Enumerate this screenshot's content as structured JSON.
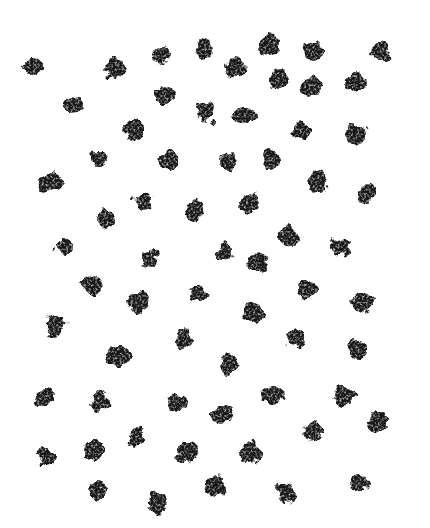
{
  "image": {
    "description": "Hand-drawn charcoal polka-dot pattern: irregular grainy dark-gray dots scattered in a loose diagonal grid on a white background",
    "background_color": "#ffffff",
    "dot_color": "#2f2f2f",
    "canvas": {
      "width": 430,
      "height": 528
    },
    "dot_count": 65,
    "dots": [
      {
        "x": 32,
        "y": 67,
        "rx": 11,
        "ry": 8,
        "rot": -10
      },
      {
        "x": 115,
        "y": 67,
        "rx": 10,
        "ry": 11,
        "rot": 0
      },
      {
        "x": 161,
        "y": 55,
        "rx": 9,
        "ry": 10,
        "rot": 0
      },
      {
        "x": 203,
        "y": 50,
        "rx": 10,
        "ry": 9,
        "rot": 0
      },
      {
        "x": 235,
        "y": 68,
        "rx": 10,
        "ry": 10,
        "rot": 0
      },
      {
        "x": 269,
        "y": 45,
        "rx": 11,
        "ry": 10,
        "rot": 0
      },
      {
        "x": 313,
        "y": 52,
        "rx": 11,
        "ry": 10,
        "rot": 0
      },
      {
        "x": 380,
        "y": 51,
        "rx": 10,
        "ry": 9,
        "rot": 15
      },
      {
        "x": 73,
        "y": 105,
        "rx": 9,
        "ry": 9,
        "rot": 0
      },
      {
        "x": 165,
        "y": 96,
        "rx": 9,
        "ry": 10,
        "rot": 0
      },
      {
        "x": 207,
        "y": 112,
        "rx": 9,
        "ry": 10,
        "rot": 0
      },
      {
        "x": 245,
        "y": 115,
        "rx": 10,
        "ry": 9,
        "rot": 0
      },
      {
        "x": 279,
        "y": 80,
        "rx": 9,
        "ry": 9,
        "rot": 0
      },
      {
        "x": 310,
        "y": 86,
        "rx": 10,
        "ry": 9,
        "rot": 0
      },
      {
        "x": 355,
        "y": 83,
        "rx": 10,
        "ry": 11,
        "rot": 0
      },
      {
        "x": 133,
        "y": 129,
        "rx": 9,
        "ry": 10,
        "rot": 0
      },
      {
        "x": 302,
        "y": 130,
        "rx": 9,
        "ry": 10,
        "rot": 0
      },
      {
        "x": 356,
        "y": 135,
        "rx": 10,
        "ry": 10,
        "rot": 0
      },
      {
        "x": 99,
        "y": 159,
        "rx": 8,
        "ry": 8,
        "rot": 0
      },
      {
        "x": 169,
        "y": 162,
        "rx": 9,
        "ry": 10,
        "rot": 0
      },
      {
        "x": 228,
        "y": 161,
        "rx": 9,
        "ry": 9,
        "rot": 0
      },
      {
        "x": 270,
        "y": 160,
        "rx": 9,
        "ry": 10,
        "rot": 0
      },
      {
        "x": 318,
        "y": 182,
        "rx": 10,
        "ry": 11,
        "rot": 0
      },
      {
        "x": 368,
        "y": 193,
        "rx": 9,
        "ry": 10,
        "rot": 0
      },
      {
        "x": 49,
        "y": 183,
        "rx": 12,
        "ry": 9,
        "rot": -25
      },
      {
        "x": 143,
        "y": 200,
        "rx": 10,
        "ry": 10,
        "rot": 0
      },
      {
        "x": 195,
        "y": 211,
        "rx": 9,
        "ry": 10,
        "rot": 0
      },
      {
        "x": 249,
        "y": 203,
        "rx": 9,
        "ry": 10,
        "rot": 0
      },
      {
        "x": 106,
        "y": 220,
        "rx": 9,
        "ry": 9,
        "rot": 0
      },
      {
        "x": 288,
        "y": 236,
        "rx": 10,
        "ry": 11,
        "rot": 0
      },
      {
        "x": 341,
        "y": 246,
        "rx": 10,
        "ry": 9,
        "rot": 0
      },
      {
        "x": 66,
        "y": 246,
        "rx": 9,
        "ry": 10,
        "rot": 0
      },
      {
        "x": 149,
        "y": 259,
        "rx": 9,
        "ry": 10,
        "rot": 0
      },
      {
        "x": 224,
        "y": 252,
        "rx": 9,
        "ry": 9,
        "rot": 0
      },
      {
        "x": 259,
        "y": 263,
        "rx": 10,
        "ry": 10,
        "rot": 0
      },
      {
        "x": 93,
        "y": 285,
        "rx": 10,
        "ry": 9,
        "rot": 20
      },
      {
        "x": 137,
        "y": 302,
        "rx": 11,
        "ry": 10,
        "rot": 0
      },
      {
        "x": 198,
        "y": 292,
        "rx": 10,
        "ry": 9,
        "rot": 15
      },
      {
        "x": 253,
        "y": 313,
        "rx": 9,
        "ry": 10,
        "rot": 0
      },
      {
        "x": 308,
        "y": 289,
        "rx": 10,
        "ry": 9,
        "rot": 0
      },
      {
        "x": 363,
        "y": 302,
        "rx": 11,
        "ry": 10,
        "rot": 0
      },
      {
        "x": 55,
        "y": 326,
        "rx": 11,
        "ry": 9,
        "rot": -35
      },
      {
        "x": 120,
        "y": 355,
        "rx": 12,
        "ry": 11,
        "rot": 0
      },
      {
        "x": 184,
        "y": 340,
        "rx": 9,
        "ry": 10,
        "rot": 0
      },
      {
        "x": 229,
        "y": 364,
        "rx": 9,
        "ry": 10,
        "rot": 0
      },
      {
        "x": 296,
        "y": 337,
        "rx": 9,
        "ry": 10,
        "rot": 0
      },
      {
        "x": 357,
        "y": 349,
        "rx": 10,
        "ry": 11,
        "rot": 0
      },
      {
        "x": 45,
        "y": 397,
        "rx": 9,
        "ry": 8,
        "rot": 0
      },
      {
        "x": 100,
        "y": 401,
        "rx": 9,
        "ry": 10,
        "rot": 0
      },
      {
        "x": 177,
        "y": 402,
        "rx": 10,
        "ry": 10,
        "rot": 0
      },
      {
        "x": 223,
        "y": 415,
        "rx": 10,
        "ry": 9,
        "rot": 0
      },
      {
        "x": 273,
        "y": 395,
        "rx": 9,
        "ry": 10,
        "rot": 0
      },
      {
        "x": 343,
        "y": 396,
        "rx": 10,
        "ry": 9,
        "rot": 0
      },
      {
        "x": 378,
        "y": 422,
        "rx": 9,
        "ry": 10,
        "rot": 0
      },
      {
        "x": 135,
        "y": 437,
        "rx": 9,
        "ry": 10,
        "rot": 0
      },
      {
        "x": 47,
        "y": 456,
        "rx": 9,
        "ry": 9,
        "rot": 0
      },
      {
        "x": 95,
        "y": 450,
        "rx": 10,
        "ry": 11,
        "rot": 20
      },
      {
        "x": 187,
        "y": 452,
        "rx": 10,
        "ry": 11,
        "rot": 0
      },
      {
        "x": 251,
        "y": 453,
        "rx": 9,
        "ry": 11,
        "rot": 0
      },
      {
        "x": 312,
        "y": 432,
        "rx": 10,
        "ry": 9,
        "rot": 0
      },
      {
        "x": 97,
        "y": 491,
        "rx": 9,
        "ry": 9,
        "rot": 0
      },
      {
        "x": 157,
        "y": 503,
        "rx": 10,
        "ry": 11,
        "rot": 0
      },
      {
        "x": 216,
        "y": 486,
        "rx": 9,
        "ry": 10,
        "rot": 0
      },
      {
        "x": 286,
        "y": 491,
        "rx": 10,
        "ry": 10,
        "rot": 0
      },
      {
        "x": 357,
        "y": 483,
        "rx": 10,
        "ry": 10,
        "rot": 0
      }
    ]
  }
}
